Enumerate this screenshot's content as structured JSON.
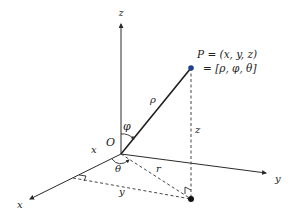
{
  "diagram": {
    "colors": {
      "line": "#2a2a2a",
      "dashed": "#444444",
      "point_P": "#1f3f8f",
      "point_projection": "#111111",
      "background": "#ffffff"
    },
    "axes": {
      "z_label": "z",
      "x_label": "x",
      "y_label": "y"
    },
    "origin_label": "O",
    "point": {
      "name": "P",
      "line1": "P = (x, y, z)",
      "line2": "= [ρ, φ, θ]"
    },
    "segment_labels": {
      "rho": "ρ",
      "phi": "φ",
      "theta": "θ",
      "r": "r",
      "z_height": "z",
      "x_component": "x",
      "y_component": "y"
    },
    "nodes": [
      {
        "id": "O",
        "label": "O",
        "x": 121,
        "y": 154
      },
      {
        "id": "P",
        "label": "P",
        "x": 191,
        "y": 68
      },
      {
        "id": "Q",
        "label": "projection of P on xy-plane",
        "x": 191,
        "y": 199
      },
      {
        "id": "Xp",
        "label": "foot on x-axis",
        "x": 73,
        "y": 179
      }
    ],
    "edges": [
      {
        "from": "O",
        "to": "z-axis tip",
        "style": "solid-arrow"
      },
      {
        "from": "O",
        "to": "x-axis tip",
        "style": "solid-arrow"
      },
      {
        "from": "O",
        "to": "y-axis tip",
        "style": "solid-arrow"
      },
      {
        "from": "O",
        "to": "P",
        "style": "solid",
        "label": "ρ"
      },
      {
        "from": "P",
        "to": "Q",
        "style": "dashed",
        "label": "z"
      },
      {
        "from": "O",
        "to": "Q",
        "style": "dashed",
        "label": "r"
      },
      {
        "from": "Xp",
        "to": "Q",
        "style": "dashed",
        "label": "y"
      }
    ]
  }
}
